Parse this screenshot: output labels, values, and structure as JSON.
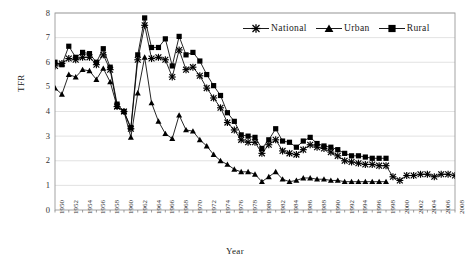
{
  "chart_data": {
    "type": "line",
    "title": "",
    "xlabel": "Year",
    "ylabel": "TFR",
    "ylim": [
      0,
      8
    ],
    "yticks": [
      0,
      1,
      2,
      3,
      4,
      5,
      6,
      7,
      8
    ],
    "xlim": [
      1950,
      2008
    ],
    "xticks": [
      1950,
      1952,
      1954,
      1956,
      1958,
      1960,
      1962,
      1964,
      1966,
      1968,
      1970,
      1972,
      1974,
      1976,
      1978,
      1980,
      1982,
      1984,
      1986,
      1988,
      1990,
      1992,
      1994,
      1996,
      1998,
      2000,
      2002,
      2004,
      2006,
      2008
    ],
    "grid": "horizontal",
    "legend_position": "top-right",
    "x": [
      1950,
      1951,
      1952,
      1953,
      1954,
      1955,
      1956,
      1957,
      1958,
      1959,
      1960,
      1961,
      1962,
      1963,
      1964,
      1965,
      1966,
      1967,
      1968,
      1969,
      1970,
      1971,
      1972,
      1973,
      1974,
      1975,
      1976,
      1977,
      1978,
      1979,
      1980,
      1981,
      1982,
      1983,
      1984,
      1985,
      1986,
      1987,
      1988,
      1989,
      1990,
      1991,
      1992,
      1993,
      1994,
      1995,
      1996,
      1997,
      1998,
      1999,
      2000,
      2001,
      2002,
      2003,
      2004,
      2005,
      2006,
      2007,
      2008
    ],
    "series": [
      {
        "name": "National",
        "marker": "asterisk",
        "color": "#000000",
        "values": [
          5.85,
          5.95,
          6.15,
          6.1,
          6.2,
          6.2,
          5.9,
          6.3,
          5.7,
          4.2,
          4.0,
          3.3,
          6.1,
          7.5,
          6.15,
          6.2,
          6.1,
          5.4,
          6.5,
          5.7,
          5.8,
          5.45,
          4.95,
          4.55,
          4.15,
          3.55,
          3.25,
          2.85,
          2.75,
          2.75,
          2.3,
          2.65,
          2.85,
          2.4,
          2.3,
          2.25,
          2.45,
          2.65,
          2.55,
          2.5,
          2.35,
          2.2,
          2.0,
          1.95,
          1.9,
          1.85,
          1.85,
          1.8,
          1.8,
          1.35,
          1.2,
          1.4,
          1.4,
          1.45,
          1.45,
          1.35,
          1.45,
          1.45,
          1.4
        ]
      },
      {
        "name": "Urban",
        "marker": "triangle",
        "color": "#000000",
        "values": [
          4.95,
          4.7,
          5.5,
          5.4,
          5.7,
          5.65,
          5.3,
          5.75,
          5.2,
          4.2,
          4.0,
          2.95,
          4.75,
          6.2,
          4.35,
          3.6,
          3.1,
          2.9,
          3.85,
          3.25,
          3.2,
          2.85,
          2.6,
          2.25,
          2.0,
          1.85,
          1.65,
          1.55,
          1.55,
          1.45,
          1.15,
          1.35,
          1.55,
          1.25,
          1.15,
          1.2,
          1.3,
          1.3,
          1.25,
          1.25,
          1.2,
          1.2,
          1.15,
          1.15,
          1.15,
          1.15,
          1.15,
          1.15,
          1.15,
          null,
          null,
          null,
          null,
          null,
          null,
          null,
          null,
          null,
          null
        ]
      },
      {
        "name": "Rural",
        "marker": "square",
        "color": "#000000",
        "values": [
          6.0,
          5.9,
          6.65,
          6.2,
          6.4,
          6.35,
          6.0,
          6.55,
          5.8,
          4.3,
          4.0,
          3.35,
          6.3,
          7.8,
          6.6,
          6.6,
          6.95,
          5.85,
          7.05,
          6.3,
          6.4,
          6.05,
          5.5,
          5.05,
          4.65,
          3.95,
          3.6,
          3.05,
          3.0,
          2.95,
          2.5,
          2.85,
          3.3,
          2.8,
          2.75,
          2.55,
          2.8,
          2.95,
          2.7,
          2.6,
          2.55,
          2.45,
          2.3,
          2.2,
          2.2,
          2.15,
          2.1,
          2.1,
          2.1,
          null,
          null,
          null,
          null,
          null,
          null,
          null,
          null,
          null,
          null
        ]
      }
    ]
  },
  "legend": {
    "items": [
      {
        "label": "National"
      },
      {
        "label": "Urban"
      },
      {
        "label": "Rural"
      }
    ]
  },
  "axes": {
    "x_title": "Year",
    "y_title": "TFR"
  }
}
